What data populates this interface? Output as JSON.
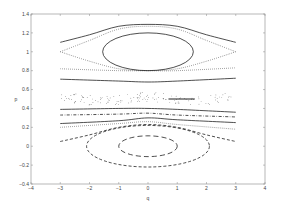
{
  "chart_data": {
    "type": "line",
    "title": "",
    "xlabel": "q",
    "ylabel": "p",
    "xlim": [
      -4,
      4
    ],
    "ylim": [
      -0.4,
      1.4
    ],
    "xticks": [
      "-4",
      "-3",
      "-2",
      "-1",
      "0",
      "1",
      "2",
      "3",
      "4"
    ],
    "yticks": [
      "-0.4",
      "-0.2",
      "0",
      "0.2",
      "0.4",
      "0.6",
      "0.8",
      "1",
      "1.2",
      "1.4"
    ],
    "grid": false,
    "legend": null,
    "series": [
      {
        "name": "upper outer orbit",
        "style": "solid",
        "x": [
          -3,
          -2,
          -1,
          0,
          1,
          2,
          3
        ],
        "y": [
          1.1,
          1.18,
          1.27,
          1.29,
          1.27,
          1.18,
          1.1
        ]
      },
      {
        "name": "upper separatrix (top branch)",
        "style": "dotted",
        "x": [
          -3,
          -2,
          -1,
          0,
          1,
          2,
          3
        ],
        "y": [
          1.0,
          1.12,
          1.24,
          1.27,
          1.24,
          1.12,
          1.0
        ]
      },
      {
        "name": "upper separatrix (bottom branch)",
        "style": "dotted",
        "x": [
          -3,
          -2,
          -1,
          0,
          1,
          2,
          3
        ],
        "y": [
          1.0,
          0.9,
          0.82,
          0.8,
          0.82,
          0.9,
          1.0
        ]
      },
      {
        "name": "upper elliptic orbit",
        "style": "solid",
        "shape": "ellipse",
        "center": [
          0,
          1.0
        ],
        "rx": 1.55,
        "ry": 0.2
      },
      {
        "name": "dotted line 0.82",
        "style": "dotted",
        "x": [
          -3,
          -1,
          0,
          1,
          3
        ],
        "y": [
          0.82,
          0.8,
          0.8,
          0.8,
          0.83
        ]
      },
      {
        "name": "solid line 0.7",
        "style": "solid",
        "x": [
          -3,
          -1,
          0,
          1,
          3
        ],
        "y": [
          0.71,
          0.69,
          0.68,
          0.69,
          0.72
        ]
      },
      {
        "name": "chaotic band",
        "style": "scatter",
        "x": [
          -3,
          -2,
          -1,
          0,
          1,
          2,
          3
        ],
        "y": [
          0.53,
          0.52,
          0.5,
          0.52,
          0.5,
          0.52,
          0.53
        ]
      },
      {
        "name": "solid line 0.38",
        "style": "solid",
        "x": [
          -3,
          -1,
          0,
          1,
          3
        ],
        "y": [
          0.39,
          0.4,
          0.4,
          0.39,
          0.36
        ]
      },
      {
        "name": "dash-dot line 0.32",
        "style": "dashdot",
        "x": [
          -3,
          -1,
          0,
          1,
          3
        ],
        "y": [
          0.33,
          0.34,
          0.35,
          0.33,
          0.31
        ]
      },
      {
        "name": "solid line 0.25",
        "style": "solid",
        "x": [
          -3,
          -1,
          0,
          1,
          3
        ],
        "y": [
          0.24,
          0.27,
          0.3,
          0.28,
          0.25
        ]
      },
      {
        "name": "dotted line 0.2",
        "style": "dotted",
        "x": [
          -3,
          -1,
          0,
          1,
          3
        ],
        "y": [
          0.2,
          0.24,
          0.26,
          0.23,
          0.18
        ]
      },
      {
        "name": "lower outer orbit",
        "style": "dashed",
        "x": [
          -3,
          -2,
          -1,
          0,
          1,
          2,
          3
        ],
        "y": [
          0.05,
          0.12,
          0.2,
          0.23,
          0.2,
          0.12,
          0.05
        ]
      },
      {
        "name": "lower elliptic orbit (outer)",
        "style": "dashed",
        "shape": "ellipse",
        "center": [
          0,
          0.0
        ],
        "rx": 2.1,
        "ry": 0.22
      },
      {
        "name": "lower elliptic orbit (inner)",
        "style": "longdash",
        "shape": "ellipse",
        "center": [
          0,
          0.0
        ],
        "rx": 1.0,
        "ry": 0.11
      }
    ]
  },
  "axes": {
    "xlabel": "q",
    "ylabel": "p"
  }
}
